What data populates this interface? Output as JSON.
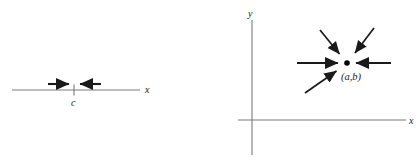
{
  "figures": {
    "left": {
      "name": "number-line-convergence",
      "axis_label": "x",
      "tick_label": "c",
      "axis": {
        "x1": 12,
        "y1": 90,
        "x2": 140,
        "y2": 90
      },
      "tick": {
        "x": 74,
        "y_top": 84,
        "y_bottom": 96
      },
      "arrows": [
        {
          "name": "arrow-from-left",
          "x1": 48,
          "y1": 84,
          "x2": 71,
          "y2": 84,
          "direction": "right"
        },
        {
          "name": "arrow-from-right",
          "x1": 101,
          "y1": 84,
          "x2": 78,
          "y2": 84,
          "direction": "left"
        }
      ],
      "axis_label_pos": {
        "x": 145,
        "y": 92
      },
      "tick_label_pos": {
        "x": 71,
        "y": 105
      }
    },
    "right": {
      "name": "plane-convergence",
      "x_axis_label": "x",
      "y_axis_label": "y",
      "point_label": "(a,b)",
      "point": {
        "x": 137,
        "y": 63,
        "r": 2.8
      },
      "x_axis": {
        "x1": 28,
        "y1": 120,
        "x2": 196,
        "y2": 120
      },
      "y_axis": {
        "x1": 42,
        "y1": 20,
        "x2": 42,
        "y2": 155
      },
      "x_axis_label_pos": {
        "x": 199,
        "y": 123
      },
      "y_axis_label_pos": {
        "x": 39,
        "y": 17
      },
      "point_label_pos": {
        "x": 131,
        "y": 79
      },
      "arrows": [
        {
          "name": "arrow-from-upper-left",
          "x1": 110,
          "y1": 30,
          "x2": 131,
          "y2": 56
        },
        {
          "name": "arrow-from-upper-right",
          "x1": 164,
          "y1": 28,
          "x2": 144,
          "y2": 55
        },
        {
          "name": "arrow-from-left",
          "x1": 87,
          "y1": 63,
          "x2": 130,
          "y2": 63
        },
        {
          "name": "arrow-from-right",
          "x1": 181,
          "y1": 63,
          "x2": 144,
          "y2": 63
        },
        {
          "name": "arrow-from-lower-left",
          "x1": 95,
          "y1": 93,
          "x2": 128,
          "y2": 70
        }
      ]
    }
  }
}
